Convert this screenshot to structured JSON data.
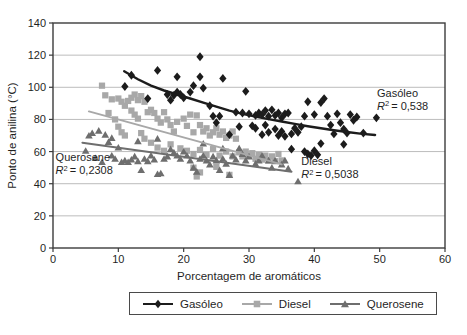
{
  "figure": {
    "background": "#ffffff",
    "axis_color": "#3c3c3c",
    "grid_color": "#bcbcbc",
    "text_color": "#1f1f1f"
  },
  "chart_data": {
    "type": "scatter",
    "title": "",
    "xlabel": "Porcentagem de aromáticos",
    "ylabel": "Ponto de anilina (°C)",
    "xlim": [
      0,
      60
    ],
    "ylim": [
      0,
      140
    ],
    "xticks": [
      0,
      10,
      20,
      30,
      40,
      50,
      60
    ],
    "yticks": [
      0,
      20,
      40,
      60,
      80,
      100,
      120,
      140
    ],
    "grid": "horizontal-only",
    "legend_position": "bottom",
    "series": [
      {
        "id": "gasoleo",
        "name": "Gasóleo",
        "marker": "diamond",
        "color": "#1c1c1c",
        "r2": "0,538",
        "trend_type": "power-curve",
        "trend": [
          [
            10.9,
            110
          ],
          [
            13,
            105
          ],
          [
            15,
            101
          ],
          [
            17,
            98
          ],
          [
            19,
            95.5
          ],
          [
            21,
            93
          ],
          [
            23,
            90.5
          ],
          [
            25,
            88
          ],
          [
            27,
            85.5
          ],
          [
            29,
            83.5
          ],
          [
            31,
            81.8
          ],
          [
            33,
            80.2
          ],
          [
            35,
            78.7
          ],
          [
            37,
            77.2
          ],
          [
            39,
            75.8
          ],
          [
            41,
            74.5
          ],
          [
            43,
            73.3
          ],
          [
            45,
            72.2
          ],
          [
            47,
            71.2
          ],
          [
            49.3,
            70.3
          ]
        ],
        "points": [
          [
            12,
            107.5
          ],
          [
            16,
            110.5
          ],
          [
            22.5,
            119
          ],
          [
            19,
            106.5
          ],
          [
            21.5,
            101
          ],
          [
            22.5,
            106.5
          ],
          [
            23,
            99.5
          ],
          [
            26,
            105.5
          ],
          [
            11,
            100.5
          ],
          [
            14.5,
            93
          ],
          [
            17.5,
            95.5
          ],
          [
            18,
            92
          ],
          [
            18.5,
            95
          ],
          [
            19,
            97
          ],
          [
            19.5,
            95.5
          ],
          [
            20,
            93.5
          ],
          [
            21,
            97
          ],
          [
            24,
            88.5
          ],
          [
            24.5,
            82
          ],
          [
            25,
            78
          ],
          [
            25.5,
            82
          ],
          [
            27,
            70.5
          ],
          [
            28,
            84.5
          ],
          [
            28.5,
            75.5
          ],
          [
            29.5,
            97.5
          ],
          [
            29,
            84
          ],
          [
            30,
            83.5
          ],
          [
            31,
            82.5
          ],
          [
            31.5,
            84
          ],
          [
            32,
            83
          ],
          [
            32.5,
            85.5
          ],
          [
            33,
            82
          ],
          [
            33.5,
            86
          ],
          [
            34,
            82.5
          ],
          [
            34.5,
            84
          ],
          [
            35,
            81
          ],
          [
            35.5,
            83.5
          ],
          [
            36,
            84
          ],
          [
            30.5,
            76
          ],
          [
            31,
            74.5
          ],
          [
            32,
            70.5
          ],
          [
            32.5,
            76.5
          ],
          [
            33,
            72
          ],
          [
            34,
            74
          ],
          [
            34.5,
            70
          ],
          [
            35,
            72.5
          ],
          [
            35.5,
            69.5
          ],
          [
            36.5,
            71
          ],
          [
            37,
            74.5
          ],
          [
            37.5,
            72
          ],
          [
            38,
            75.5
          ],
          [
            38.5,
            82
          ],
          [
            39,
            91
          ],
          [
            40,
            83
          ],
          [
            41,
            90.5
          ],
          [
            41.5,
            93
          ],
          [
            42,
            82
          ],
          [
            42.5,
            76.5
          ],
          [
            43,
            71
          ],
          [
            43.5,
            83.5
          ],
          [
            44,
            78
          ],
          [
            44.5,
            74
          ],
          [
            45,
            71.5
          ],
          [
            45.5,
            83
          ],
          [
            46,
            79.5
          ],
          [
            46.5,
            81.5
          ],
          [
            47.5,
            71.5
          ],
          [
            49.5,
            81
          ],
          [
            38.5,
            60
          ],
          [
            39,
            58.5
          ],
          [
            39.5,
            57.5
          ],
          [
            40,
            60.5
          ],
          [
            40.5,
            58
          ],
          [
            41,
            65
          ],
          [
            36.5,
            61.5
          ],
          [
            44.5,
            64.5
          ]
        ]
      },
      {
        "id": "diesel",
        "name": "Diesel",
        "marker": "square",
        "color": "#a8a8a8",
        "r2": "0,5038",
        "trend_type": "linear",
        "trend": [
          [
            5.5,
            85
          ],
          [
            35,
            52
          ]
        ],
        "points": [
          [
            7.5,
            101
          ],
          [
            8,
            95
          ],
          [
            9,
            92.5
          ],
          [
            8.5,
            84
          ],
          [
            9.5,
            80
          ],
          [
            10,
            93
          ],
          [
            10.5,
            91
          ],
          [
            11,
            88.5
          ],
          [
            11.5,
            91.5
          ],
          [
            12,
            93.5
          ],
          [
            12.5,
            95.5
          ],
          [
            13,
            92
          ],
          [
            13.5,
            94.5
          ],
          [
            14,
            91
          ],
          [
            12,
            85.5
          ],
          [
            12.5,
            83
          ],
          [
            13,
            80.5
          ],
          [
            14.5,
            84.5
          ],
          [
            15,
            86
          ],
          [
            15.5,
            84
          ],
          [
            16,
            80.5
          ],
          [
            16.5,
            78
          ],
          [
            17,
            84.5
          ],
          [
            17.5,
            80
          ],
          [
            18,
            76.5
          ],
          [
            18.5,
            72.5
          ],
          [
            19,
            78.5
          ],
          [
            20,
            80.5
          ],
          [
            20.5,
            76
          ],
          [
            21,
            83
          ],
          [
            21.5,
            72
          ],
          [
            22,
            82.5
          ],
          [
            22.5,
            76.5
          ],
          [
            23,
            72.5
          ],
          [
            23.5,
            74.5
          ],
          [
            24,
            70
          ],
          [
            24.5,
            72
          ],
          [
            25,
            74.5
          ],
          [
            25.5,
            70.5
          ],
          [
            26,
            72.5
          ],
          [
            26.5,
            68.5
          ],
          [
            27,
            70
          ],
          [
            27.5,
            72.5
          ],
          [
            28,
            68
          ],
          [
            10,
            75.5
          ],
          [
            10.5,
            72
          ],
          [
            11,
            70
          ],
          [
            13.5,
            71.5
          ],
          [
            14,
            68
          ],
          [
            15,
            65.5
          ],
          [
            16,
            62.5
          ],
          [
            17,
            60.5
          ],
          [
            18,
            64.5
          ],
          [
            19.5,
            62
          ],
          [
            20.5,
            60.5
          ],
          [
            21.5,
            58.5
          ],
          [
            22.5,
            61
          ],
          [
            23.5,
            58
          ],
          [
            24.5,
            61.5
          ],
          [
            25.5,
            57.5
          ],
          [
            26.5,
            60
          ],
          [
            27.5,
            57
          ],
          [
            28.5,
            59.5
          ],
          [
            29,
            57
          ],
          [
            29.5,
            60
          ],
          [
            30,
            57.5
          ],
          [
            30.5,
            59
          ],
          [
            31,
            55.5
          ],
          [
            31.5,
            58
          ],
          [
            32,
            55
          ],
          [
            32.5,
            57.5
          ],
          [
            33,
            54.5
          ],
          [
            33.5,
            57
          ],
          [
            34,
            54
          ],
          [
            34.5,
            58.5
          ],
          [
            35,
            54.5
          ],
          [
            22,
            44.5
          ],
          [
            22.5,
            47
          ],
          [
            25,
            50.5
          ],
          [
            27,
            45.5
          ],
          [
            21.5,
            50
          ]
        ]
      },
      {
        "id": "querosene",
        "name": "Querosene",
        "marker": "triangle",
        "color": "#6e6e6e",
        "r2": "0,2308",
        "trend_type": "linear",
        "trend": [
          [
            4.5,
            65.5
          ],
          [
            36.5,
            47.5
          ]
        ],
        "points": [
          [
            5,
            60.5
          ],
          [
            5.5,
            70
          ],
          [
            6,
            71.5
          ],
          [
            7,
            73
          ],
          [
            8,
            70.5
          ],
          [
            8.5,
            66
          ],
          [
            9,
            68.5
          ],
          [
            9,
            57.5
          ],
          [
            9.5,
            55.5
          ],
          [
            10,
            62.5
          ],
          [
            10.5,
            53.5
          ],
          [
            11,
            54.5
          ],
          [
            11.5,
            53.5
          ],
          [
            12,
            55
          ],
          [
            12.5,
            57
          ],
          [
            13,
            54
          ],
          [
            13,
            66.5
          ],
          [
            13.5,
            48.5
          ],
          [
            14,
            55.5
          ],
          [
            14.5,
            54
          ],
          [
            15,
            57.5
          ],
          [
            15.5,
            55
          ],
          [
            16,
            46
          ],
          [
            16.5,
            46.5
          ],
          [
            16,
            68
          ],
          [
            17,
            55.5
          ],
          [
            17.5,
            57
          ],
          [
            18,
            61.5
          ],
          [
            18.5,
            59.5
          ],
          [
            19,
            57.5
          ],
          [
            19.5,
            55.5
          ],
          [
            20,
            60
          ],
          [
            20.5,
            57.5
          ],
          [
            21,
            54.5
          ],
          [
            21.5,
            50
          ],
          [
            22,
            47.5
          ],
          [
            22.5,
            55.5
          ],
          [
            23,
            57.5
          ],
          [
            23,
            65
          ],
          [
            23.5,
            54.5
          ],
          [
            24,
            52
          ],
          [
            24.5,
            57
          ],
          [
            25,
            54.5
          ],
          [
            25.5,
            48.5
          ],
          [
            26,
            55.5
          ],
          [
            26,
            62
          ],
          [
            26.5,
            52.5
          ],
          [
            27,
            45.5
          ],
          [
            27.5,
            57.5
          ],
          [
            28,
            55
          ],
          [
            28.5,
            62
          ],
          [
            29,
            58.5
          ],
          [
            29.5,
            54.5
          ],
          [
            30,
            57
          ],
          [
            31,
            52.5
          ],
          [
            31.5,
            54.5
          ],
          [
            32,
            57.5
          ],
          [
            33,
            54.5
          ],
          [
            33.5,
            50
          ],
          [
            34,
            54.5
          ],
          [
            35,
            52
          ],
          [
            35.5,
            54.5
          ],
          [
            36,
            49.5
          ],
          [
            37.5,
            41.5
          ],
          [
            6.5,
            56
          ],
          [
            7.5,
            53.5
          ]
        ]
      }
    ],
    "annotations": [
      {
        "series_id": "gasoleo",
        "name_label": "Gasóleo",
        "r2_prefix": "R",
        "r2_sup": "2",
        "r2_eq": "= 0,538",
        "x": 49.6,
        "y": 94.0
      },
      {
        "series_id": "diesel",
        "name_label": "Diesel",
        "r2_prefix": "R",
        "r2_sup": "2",
        "r2_eq": "= 0,5038",
        "x": 38.0,
        "y": 51.5
      },
      {
        "series_id": "querosene",
        "name_label": "Querosene",
        "r2_prefix": "R",
        "r2_sup": "2",
        "r2_eq": "= 0,2308",
        "x": 0.4,
        "y": 54.0
      }
    ]
  }
}
